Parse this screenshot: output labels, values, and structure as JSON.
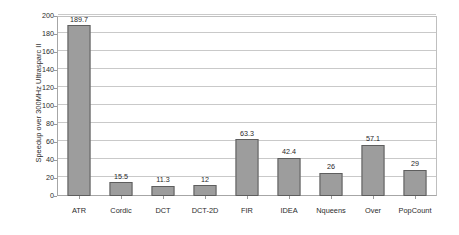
{
  "chart_data": {
    "type": "bar",
    "title": "",
    "xlabel": "",
    "ylabel": "Speedup over 300MHz Ultrasparc II",
    "ylim": [
      0,
      200
    ],
    "ytick_step": 20,
    "yticks": [
      0,
      20,
      40,
      60,
      80,
      100,
      120,
      140,
      160,
      180,
      200
    ],
    "grid": "horizontal",
    "legend": "none",
    "categories": [
      "ATR",
      "Cordic",
      "DCT",
      "DCT-2D",
      "FIR",
      "IDEA",
      "Nqueens",
      "Over",
      "PopCount"
    ],
    "values": [
      189.7,
      15.5,
      11.3,
      12,
      63.3,
      42.4,
      26,
      57.1,
      29
    ],
    "value_labels": [
      "189.7",
      "15.5",
      "11.3",
      "12",
      "63.3",
      "42.4",
      "26",
      "57.1",
      "29"
    ],
    "series": [
      {
        "name": "Speedup",
        "values": [
          189.7,
          15.5,
          11.3,
          12,
          63.3,
          42.4,
          26,
          57.1,
          29
        ]
      }
    ]
  },
  "style": {
    "bar_fill": "#9d9d9d",
    "bar_stroke": "#5e5e5e",
    "gridline_color": "#c9c9c9",
    "axis_color": "#a6a6a6",
    "text_color": "#2b2b2b",
    "background": "#ffffff"
  }
}
